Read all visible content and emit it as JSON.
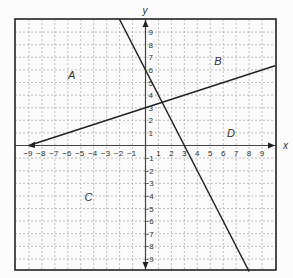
{
  "chart_data": {
    "type": "line",
    "title": "",
    "xlabel": "x",
    "ylabel": "y",
    "xlim": [
      -10,
      10
    ],
    "ylim": [
      -10,
      10
    ],
    "grid": true,
    "x_ticks": [
      -9,
      -8,
      -7,
      -6,
      -5,
      -4,
      -3,
      -2,
      -1,
      1,
      2,
      3,
      4,
      5,
      6,
      7,
      8,
      9
    ],
    "y_ticks": [
      9,
      8,
      7,
      6,
      5,
      4,
      3,
      2,
      1,
      -1,
      -2,
      -3,
      -4,
      -5,
      -6,
      -7,
      -8,
      -9
    ],
    "series": [
      {
        "name": "line 1",
        "equation": "y = -2x + 6",
        "points": [
          [
            -2,
            10
          ],
          [
            8,
            -10
          ]
        ]
      },
      {
        "name": "line 2",
        "equation": "y = x/3 + 3",
        "points": [
          [
            -9,
            0
          ],
          [
            10,
            6.33
          ]
        ]
      }
    ],
    "region_labels": [
      {
        "label": "A",
        "x": -5.7,
        "y": 5.3
      },
      {
        "label": "B",
        "x": 5.6,
        "y": 6.4
      },
      {
        "label": "C",
        "x": -4.4,
        "y": -4.4
      },
      {
        "label": "D",
        "x": 6.6,
        "y": 0.7
      }
    ]
  },
  "colors": {
    "line": "#222222",
    "grid": "#b0b0b0",
    "frame": "#222222",
    "axis": "#444444"
  }
}
